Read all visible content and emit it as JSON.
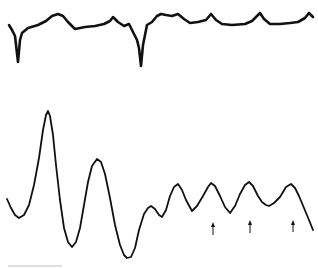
{
  "figure": {
    "description": "Two signal recordings: upper trace with periodic sharp downward deflections and small peaks; lower trace with large damped oscillations followed by regular smaller oscillations marked by arrows",
    "colors": {
      "trace": "#111111",
      "background": "#ffffff",
      "scale_bar": "#bdbdbd"
    }
  },
  "chart_data": [
    {
      "type": "line",
      "title": "",
      "xlabel": "",
      "ylabel": "",
      "grid": false,
      "legend": null,
      "series": [
        {
          "name": "upper-trace",
          "stroke_width": 2.6,
          "points": [
            [
              9,
              25
            ],
            [
              12,
              30
            ],
            [
              15,
              36
            ],
            [
              18,
              62
            ],
            [
              20,
              40
            ],
            [
              22,
              33
            ],
            [
              28,
              28
            ],
            [
              38,
              25
            ],
            [
              46,
              21
            ],
            [
              52,
              16
            ],
            [
              58,
              14
            ],
            [
              63,
              16
            ],
            [
              68,
              22
            ],
            [
              75,
              29
            ],
            [
              85,
              27
            ],
            [
              95,
              26
            ],
            [
              104,
              24
            ],
            [
              110,
              21
            ],
            [
              113,
              17
            ],
            [
              118,
              22
            ],
            [
              124,
              26
            ],
            [
              129,
              24
            ],
            [
              133,
              32
            ],
            [
              137,
              40
            ],
            [
              139,
              48
            ],
            [
              141,
              66
            ],
            [
              143,
              45
            ],
            [
              147,
              25
            ],
            [
              152,
              22
            ],
            [
              157,
              16
            ],
            [
              161,
              14
            ],
            [
              166,
              15
            ],
            [
              172,
              16
            ],
            [
              178,
              14
            ],
            [
              184,
              19
            ],
            [
              190,
              23
            ],
            [
              198,
              22
            ],
            [
              206,
              20
            ],
            [
              211,
              14
            ],
            [
              216,
              20
            ],
            [
              222,
              24
            ],
            [
              232,
              25
            ],
            [
              245,
              24
            ],
            [
              252,
              21
            ],
            [
              257,
              16
            ],
            [
              260,
              13
            ],
            [
              264,
              19
            ],
            [
              270,
              24
            ],
            [
              280,
              24
            ],
            [
              290,
              23
            ],
            [
              298,
              22
            ],
            [
              305,
              18
            ],
            [
              309,
              13
            ],
            [
              313,
              17
            ]
          ]
        },
        {
          "name": "lower-trace",
          "stroke_width": 1.8,
          "points": [
            [
              7,
              199
            ],
            [
              11,
              208
            ],
            [
              15,
              215
            ],
            [
              19,
              218
            ],
            [
              24,
              215
            ],
            [
              29,
              205
            ],
            [
              34,
              185
            ],
            [
              39,
              158
            ],
            [
              43,
              130
            ],
            [
              46,
              115
            ],
            [
              48,
              111
            ],
            [
              50,
              116
            ],
            [
              53,
              135
            ],
            [
              56,
              165
            ],
            [
              60,
              200
            ],
            [
              64,
              228
            ],
            [
              68,
              242
            ],
            [
              72,
              247
            ],
            [
              76,
              242
            ],
            [
              80,
              228
            ],
            [
              84,
              205
            ],
            [
              88,
              182
            ],
            [
              92,
              166
            ],
            [
              97,
              159
            ],
            [
              101,
              162
            ],
            [
              105,
              174
            ],
            [
              110,
              198
            ],
            [
              115,
              225
            ],
            [
              120,
              245
            ],
            [
              124,
              255
            ],
            [
              127,
              258
            ],
            [
              131,
              257
            ],
            [
              135,
              248
            ],
            [
              139,
              230
            ],
            [
              144,
              214
            ],
            [
              148,
              208
            ],
            [
              151,
              206
            ],
            [
              155,
              209
            ],
            [
              159,
              215
            ],
            [
              162,
              217
            ],
            [
              166,
              210
            ],
            [
              170,
              196
            ],
            [
              174,
              187
            ],
            [
              178,
              184
            ],
            [
              182,
              190
            ],
            [
              186,
              200
            ],
            [
              192,
              211
            ],
            [
              197,
              206
            ],
            [
              203,
              196
            ],
            [
              208,
              187
            ],
            [
              211,
              183
            ],
            [
              215,
              186
            ],
            [
              220,
              196
            ],
            [
              225,
              207
            ],
            [
              230,
              213
            ],
            [
              235,
              206
            ],
            [
              240,
              194
            ],
            [
              245,
              185
            ],
            [
              249,
              182
            ],
            [
              253,
              186
            ],
            [
              258,
              196
            ],
            [
              262,
              202
            ],
            [
              266,
              205
            ],
            [
              269,
              206
            ],
            [
              274,
              203
            ],
            [
              280,
              197
            ],
            [
              286,
              187
            ],
            [
              291,
              184
            ],
            [
              295,
              188
            ],
            [
              299,
              196
            ],
            [
              304,
              208
            ],
            [
              309,
              220
            ],
            [
              313,
              230
            ]
          ]
        }
      ],
      "annotations": {
        "arrows": [
          {
            "x": 213,
            "y_tip": 222,
            "y_tail": 235,
            "direction": "up"
          },
          {
            "x": 250,
            "y_tip": 220,
            "y_tail": 233,
            "direction": "up"
          },
          {
            "x": 293,
            "y_tip": 220,
            "y_tail": 232,
            "direction": "up"
          }
        ],
        "scale_bar": {
          "x1": 8,
          "x2": 62,
          "y": 266,
          "label": ""
        }
      },
      "xlim": [
        0,
        318
      ],
      "ylim": [
        268,
        0
      ]
    }
  ]
}
